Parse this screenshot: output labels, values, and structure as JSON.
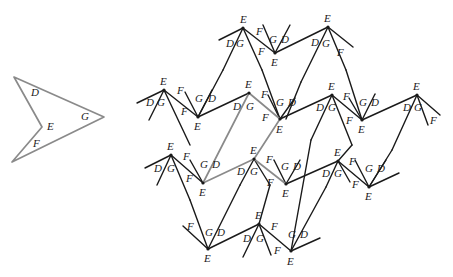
{
  "figure": {
    "colors": {
      "line": "#1a1a1a",
      "highlight": "#8a8a8a",
      "background": "#ffffff"
    },
    "prototile": {
      "vertices": [
        [
          14,
          77
        ],
        [
          104,
          117
        ],
        [
          12,
          162
        ],
        [
          42,
          127
        ]
      ],
      "labels": [
        {
          "text": "D",
          "x": 31,
          "y": 96
        },
        {
          "text": "G",
          "x": 81,
          "y": 120
        },
        {
          "text": "E",
          "x": 47,
          "y": 130
        },
        {
          "text": "F",
          "x": 33,
          "y": 147
        }
      ]
    },
    "gray_path": [
      [
        203,
        183
      ],
      [
        249,
        93
      ],
      [
        280,
        119
      ],
      [
        254,
        159
      ],
      [
        286,
        184
      ]
    ],
    "gray_path_extra": [
      [
        203,
        183
      ],
      [
        254,
        159
      ]
    ],
    "segments": [
      [
        [
          219,
          40
        ],
        [
          243,
          28
        ]
      ],
      [
        [
          243,
          28
        ],
        [
          223,
          70
        ]
      ],
      [
        [
          243,
          28
        ],
        [
          262,
          70
        ]
      ],
      [
        [
          243,
          28
        ],
        [
          275,
          53
        ]
      ],
      [
        [
          275,
          53
        ],
        [
          263,
          25
        ]
      ],
      [
        [
          275,
          53
        ],
        [
          290,
          25
        ]
      ],
      [
        [
          275,
          53
        ],
        [
          328,
          27
        ]
      ],
      [
        [
          328,
          27
        ],
        [
          353,
          47
        ]
      ],
      [
        [
          328,
          27
        ],
        [
          301,
          82
        ]
      ],
      [
        [
          328,
          27
        ],
        [
          346,
          70
        ]
      ],
      [
        [
          223,
          70
        ],
        [
          198,
          117
        ]
      ],
      [
        [
          262,
          70
        ],
        [
          280,
          119
        ]
      ],
      [
        [
          137,
          103
        ],
        [
          164,
          90
        ]
      ],
      [
        [
          164,
          90
        ],
        [
          149,
          120
        ]
      ],
      [
        [
          164,
          90
        ],
        [
          198,
          117
        ]
      ],
      [
        [
          164,
          90
        ],
        [
          190,
          145
        ]
      ],
      [
        [
          198,
          117
        ],
        [
          185,
          92
        ]
      ],
      [
        [
          198,
          117
        ],
        [
          212,
          90
        ]
      ],
      [
        [
          198,
          117
        ],
        [
          249,
          93
        ]
      ],
      [
        [
          280,
          119
        ],
        [
          268,
          95
        ]
      ],
      [
        [
          280,
          119
        ],
        [
          295,
          98
        ]
      ],
      [
        [
          280,
          119
        ],
        [
          332,
          95
        ]
      ],
      [
        [
          301,
          82
        ],
        [
          286,
          119
        ]
      ],
      [
        [
          346,
          70
        ],
        [
          362,
          120
        ]
      ],
      [
        [
          332,
          95
        ],
        [
          362,
          120
        ]
      ],
      [
        [
          332,
          95
        ],
        [
          311,
          140
        ]
      ],
      [
        [
          332,
          95
        ],
        [
          352,
          145
        ]
      ],
      [
        [
          362,
          120
        ],
        [
          349,
          98
        ]
      ],
      [
        [
          362,
          120
        ],
        [
          375,
          94
        ]
      ],
      [
        [
          362,
          120
        ],
        [
          417,
          95
        ]
      ],
      [
        [
          417,
          95
        ],
        [
          440,
          115
        ]
      ],
      [
        [
          417,
          95
        ],
        [
          428,
          125
        ]
      ],
      [
        [
          417,
          95
        ],
        [
          392,
          150
        ]
      ],
      [
        [
          145,
          168
        ],
        [
          171,
          155
        ]
      ],
      [
        [
          171,
          155
        ],
        [
          157,
          185
        ]
      ],
      [
        [
          171,
          155
        ],
        [
          203,
          183
        ]
      ],
      [
        [
          171,
          155
        ],
        [
          190,
          200
        ]
      ],
      [
        [
          203,
          183
        ],
        [
          190,
          160
        ]
      ],
      [
        [
          254,
          159
        ],
        [
          240,
          185
        ]
      ],
      [
        [
          254,
          159
        ],
        [
          270,
          185
        ]
      ],
      [
        [
          286,
          184
        ],
        [
          274,
          160
        ]
      ],
      [
        [
          286,
          184
        ],
        [
          300,
          160
        ]
      ],
      [
        [
          286,
          184
        ],
        [
          338,
          161
        ]
      ],
      [
        [
          338,
          161
        ],
        [
          326,
          187
        ]
      ],
      [
        [
          338,
          161
        ],
        [
          350,
          182
        ]
      ],
      [
        [
          338,
          161
        ],
        [
          369,
          187
        ]
      ],
      [
        [
          369,
          187
        ],
        [
          355,
          160
        ]
      ],
      [
        [
          369,
          187
        ],
        [
          386,
          160
        ]
      ],
      [
        [
          369,
          187
        ],
        [
          399,
          173
        ]
      ],
      [
        [
          392,
          150
        ],
        [
          369,
          187
        ]
      ],
      [
        [
          352,
          145
        ],
        [
          338,
          161
        ]
      ],
      [
        [
          190,
          200
        ],
        [
          208,
          249
        ]
      ],
      [
        [
          240,
          185
        ],
        [
          208,
          249
        ]
      ],
      [
        [
          183,
          226
        ],
        [
          208,
          249
        ]
      ],
      [
        [
          208,
          249
        ],
        [
          259,
          224
        ]
      ],
      [
        [
          259,
          224
        ],
        [
          243,
          257
        ]
      ],
      [
        [
          259,
          224
        ],
        [
          271,
          255
        ]
      ],
      [
        [
          259,
          224
        ],
        [
          291,
          251
        ]
      ],
      [
        [
          270,
          185
        ],
        [
          259,
          224
        ]
      ],
      [
        [
          311,
          140
        ],
        [
          291,
          251
        ]
      ],
      [
        [
          291,
          251
        ],
        [
          320,
          238
        ]
      ],
      [
        [
          326,
          187
        ],
        [
          291,
          251
        ]
      ]
    ],
    "vertex_labels": [
      {
        "text": "E",
        "x": 240,
        "y": 23
      },
      {
        "text": "D",
        "x": 226,
        "y": 47
      },
      {
        "text": "G",
        "x": 236,
        "y": 47
      },
      {
        "text": "F",
        "x": 256,
        "y": 35
      },
      {
        "text": "F",
        "x": 258,
        "y": 55
      },
      {
        "text": "G",
        "x": 269,
        "y": 43
      },
      {
        "text": "D",
        "x": 281,
        "y": 43
      },
      {
        "text": "E",
        "x": 271,
        "y": 66
      },
      {
        "text": "E",
        "x": 324,
        "y": 22
      },
      {
        "text": "D",
        "x": 311,
        "y": 46
      },
      {
        "text": "G",
        "x": 322,
        "y": 47
      },
      {
        "text": "F",
        "x": 337,
        "y": 56
      },
      {
        "text": "E",
        "x": 160,
        "y": 85
      },
      {
        "text": "D",
        "x": 146,
        "y": 106
      },
      {
        "text": "G",
        "x": 157,
        "y": 106
      },
      {
        "text": "F",
        "x": 177,
        "y": 94
      },
      {
        "text": "F",
        "x": 181,
        "y": 115
      },
      {
        "text": "G",
        "x": 195,
        "y": 102
      },
      {
        "text": "D",
        "x": 208,
        "y": 102
      },
      {
        "text": "E",
        "x": 194,
        "y": 130
      },
      {
        "text": "E",
        "x": 245,
        "y": 88
      },
      {
        "text": "D",
        "x": 233,
        "y": 110
      },
      {
        "text": "G",
        "x": 246,
        "y": 110
      },
      {
        "text": "F",
        "x": 261,
        "y": 98
      },
      {
        "text": "F",
        "x": 262,
        "y": 121
      },
      {
        "text": "G",
        "x": 276,
        "y": 106
      },
      {
        "text": "D",
        "x": 288,
        "y": 106
      },
      {
        "text": "E",
        "x": 276,
        "y": 133
      },
      {
        "text": "E",
        "x": 328,
        "y": 90
      },
      {
        "text": "D",
        "x": 316,
        "y": 111
      },
      {
        "text": "G",
        "x": 328,
        "y": 111
      },
      {
        "text": "F",
        "x": 343,
        "y": 100
      },
      {
        "text": "F",
        "x": 346,
        "y": 124
      },
      {
        "text": "G",
        "x": 359,
        "y": 106
      },
      {
        "text": "D",
        "x": 371,
        "y": 106
      },
      {
        "text": "E",
        "x": 358,
        "y": 133
      },
      {
        "text": "E",
        "x": 413,
        "y": 90
      },
      {
        "text": "D",
        "x": 403,
        "y": 111
      },
      {
        "text": "G",
        "x": 414,
        "y": 111
      },
      {
        "text": "F",
        "x": 430,
        "y": 124
      },
      {
        "text": "E",
        "x": 167,
        "y": 150
      },
      {
        "text": "D",
        "x": 154,
        "y": 172
      },
      {
        "text": "G",
        "x": 167,
        "y": 172
      },
      {
        "text": "F",
        "x": 183,
        "y": 160
      },
      {
        "text": "F",
        "x": 186,
        "y": 182
      },
      {
        "text": "G",
        "x": 200,
        "y": 168
      },
      {
        "text": "D",
        "x": 212,
        "y": 168
      },
      {
        "text": "E",
        "x": 199,
        "y": 196
      },
      {
        "text": "E",
        "x": 250,
        "y": 154
      },
      {
        "text": "D",
        "x": 237,
        "y": 175
      },
      {
        "text": "G",
        "x": 250,
        "y": 175
      },
      {
        "text": "F",
        "x": 266,
        "y": 163
      },
      {
        "text": "F",
        "x": 267,
        "y": 186
      },
      {
        "text": "G",
        "x": 281,
        "y": 170
      },
      {
        "text": "D",
        "x": 293,
        "y": 170
      },
      {
        "text": "E",
        "x": 282,
        "y": 197
      },
      {
        "text": "E",
        "x": 334,
        "y": 156
      },
      {
        "text": "D",
        "x": 322,
        "y": 177
      },
      {
        "text": "G",
        "x": 334,
        "y": 177
      },
      {
        "text": "F",
        "x": 349,
        "y": 165
      },
      {
        "text": "F",
        "x": 352,
        "y": 188
      },
      {
        "text": "G",
        "x": 365,
        "y": 172
      },
      {
        "text": "D",
        "x": 377,
        "y": 172
      },
      {
        "text": "E",
        "x": 365,
        "y": 200
      },
      {
        "text": "F",
        "x": 187,
        "y": 230
      },
      {
        "text": "G",
        "x": 205,
        "y": 236
      },
      {
        "text": "D",
        "x": 217,
        "y": 236
      },
      {
        "text": "E",
        "x": 204,
        "y": 262
      },
      {
        "text": "E",
        "x": 255,
        "y": 219
      },
      {
        "text": "D",
        "x": 243,
        "y": 242
      },
      {
        "text": "G",
        "x": 256,
        "y": 242
      },
      {
        "text": "F",
        "x": 271,
        "y": 230
      },
      {
        "text": "F",
        "x": 274,
        "y": 254
      },
      {
        "text": "G",
        "x": 288,
        "y": 238
      },
      {
        "text": "D",
        "x": 300,
        "y": 238
      },
      {
        "text": "E",
        "x": 287,
        "y": 265
      }
    ],
    "dots": [
      [
        243,
        28
      ],
      [
        275,
        53
      ],
      [
        328,
        27
      ],
      [
        164,
        90
      ],
      [
        198,
        117
      ],
      [
        249,
        93
      ],
      [
        280,
        119
      ],
      [
        332,
        95
      ],
      [
        362,
        120
      ],
      [
        417,
        95
      ],
      [
        171,
        155
      ],
      [
        203,
        183
      ],
      [
        254,
        159
      ],
      [
        286,
        184
      ],
      [
        338,
        161
      ],
      [
        369,
        187
      ],
      [
        208,
        249
      ],
      [
        259,
        224
      ],
      [
        291,
        251
      ]
    ]
  }
}
